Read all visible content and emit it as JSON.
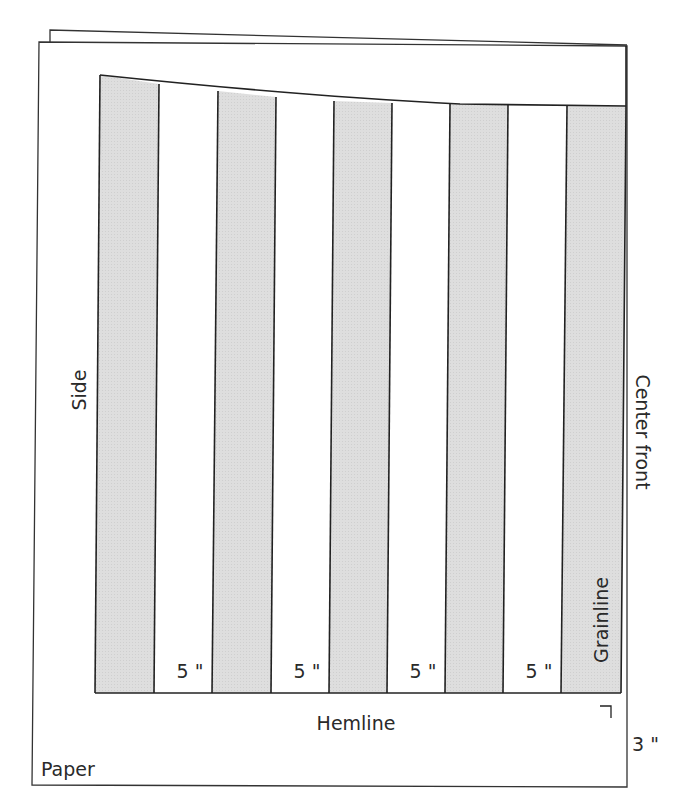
{
  "diagram": {
    "type": "sewing-pattern-slash-and-spread",
    "labels": {
      "side": "Side",
      "center_front": "Center front",
      "grainline": "Grainline",
      "hemline": "Hemline",
      "paper": "Paper",
      "hem_allowance": "3 \"",
      "spread_amount": "5 \""
    },
    "spread_gaps": [
      {
        "index": 1,
        "label": "5 \""
      },
      {
        "index": 2,
        "label": "5 \""
      },
      {
        "index": 3,
        "label": "5 \""
      },
      {
        "index": 4,
        "label": "5 \""
      }
    ],
    "pattern_strips": 5,
    "colors": {
      "strip_fill": "#dcdcdc",
      "line": "#222222",
      "paper": "#ffffff"
    }
  }
}
